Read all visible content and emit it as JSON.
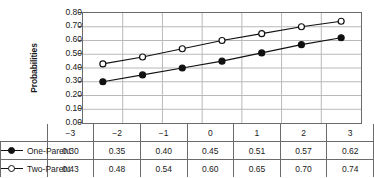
{
  "chart_data": {
    "type": "line",
    "title": "",
    "xlabel": "",
    "ylabel": "Probabilities",
    "categories": [
      "−3",
      "−2",
      "−1",
      "0",
      "1",
      "2",
      "3"
    ],
    "x": [
      -3,
      -2,
      -1,
      0,
      1,
      2,
      3
    ],
    "ylim": [
      0.0,
      0.8
    ],
    "xlim": [
      -3,
      3
    ],
    "grid": true,
    "legend_position": "table-left",
    "ytick_labels": [
      "0.80",
      "0.70",
      "0.60",
      "0.50",
      "0.40",
      "0.30",
      "0.20",
      "0.10",
      "0.00"
    ],
    "ytick_values": [
      0.8,
      0.7,
      0.6,
      0.5,
      0.4,
      0.3,
      0.2,
      0.1,
      0.0
    ],
    "series": [
      {
        "name": "One-Parent",
        "marker": "filled-circle",
        "color": "#111111",
        "values": [
          0.3,
          0.35,
          0.4,
          0.45,
          0.51,
          0.57,
          0.62
        ]
      },
      {
        "name": "Two-Parent",
        "marker": "open-circle",
        "color": "#111111",
        "values": [
          0.43,
          0.48,
          0.54,
          0.6,
          0.65,
          0.7,
          0.74
        ]
      }
    ]
  },
  "colors": {
    "axis": "#6b6b6b",
    "grid": "#b9b9b9",
    "line": "#111111",
    "text": "#1a1a1a",
    "background": "#ffffff"
  }
}
